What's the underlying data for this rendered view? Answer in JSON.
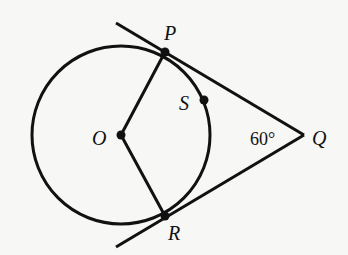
{
  "diagram": {
    "type": "geometry",
    "points": {
      "O": {
        "label": "O",
        "role": "center"
      },
      "P": {
        "label": "P",
        "role": "tangent point"
      },
      "R": {
        "label": "R",
        "role": "tangent point"
      },
      "Q": {
        "label": "Q",
        "role": "external point"
      },
      "S": {
        "label": "S",
        "role": "point on arc"
      }
    },
    "angle": {
      "vertex": "Q",
      "label": "60°",
      "value": 60
    },
    "segments": [
      "OP",
      "OR",
      "PQ",
      "RQ"
    ],
    "colors": {
      "stroke": "#111111",
      "background": "#f7f7f5"
    }
  }
}
